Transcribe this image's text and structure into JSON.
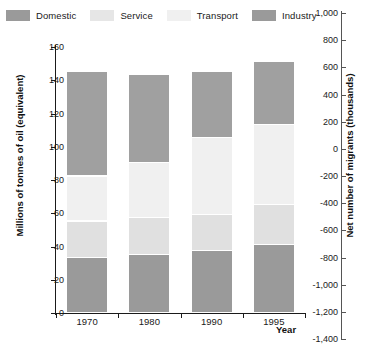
{
  "chart_data": {
    "type": "bar",
    "stacked": true,
    "title": "",
    "subtitle": "",
    "categories": [
      "1970",
      "1980",
      "1990",
      "1995"
    ],
    "xlabel": "Year",
    "ylabel": "Millions of tonnes of oil (equivalent)",
    "ylabel_right": "Net number of migrants (thousands)",
    "ylim": [
      0,
      160
    ],
    "ylim_right": [
      -1400,
      1000
    ],
    "yticks": [
      "160",
      "140",
      "120",
      "100",
      "80",
      "60",
      "40",
      "20",
      "0"
    ],
    "ytick_values": [
      160,
      140,
      120,
      100,
      80,
      60,
      40,
      20,
      0
    ],
    "yticks_right": [
      "1,000",
      "800",
      "600",
      "400",
      "200",
      "0",
      "-200",
      "-400",
      "-600",
      "-800",
      "-1,000",
      "-1,200",
      "-1,400"
    ],
    "ytick_values_right": [
      1000,
      800,
      600,
      400,
      200,
      0,
      -200,
      -400,
      -600,
      -800,
      -1000,
      -1200,
      -1400
    ],
    "grid": false,
    "legend_position": "top-left",
    "series": [
      {
        "name": "Domestic",
        "color": "#9a9a9a",
        "values": [
          33,
          35,
          37,
          41
        ]
      },
      {
        "name": "Service",
        "color": "#e0e0e0",
        "values": [
          22,
          22,
          22,
          24
        ]
      },
      {
        "name": "Transport",
        "color": "#f0f0f0",
        "values": [
          27,
          33,
          46,
          48
        ]
      },
      {
        "name": "Industry",
        "color": "#a0a0a0",
        "values": [
          63,
          53,
          40,
          38
        ]
      }
    ],
    "stack_order_bottom_to_top": [
      "Domestic",
      "Service",
      "Transport",
      "Industry"
    ],
    "totals": [
      145,
      143,
      145,
      151
    ]
  },
  "legend": {
    "items": [
      {
        "label": "Domestic",
        "color": "#9a9a9a"
      },
      {
        "label": "Service",
        "color": "#e6e6e6"
      },
      {
        "label": "Transport",
        "color": "#f0f0f0"
      },
      {
        "label": "Industry",
        "color": "#9a9a9a"
      }
    ]
  },
  "colors": {
    "axis": "#1a1a1a",
    "axis_right": "#555555",
    "background": "#ffffff",
    "text": "#111111"
  }
}
